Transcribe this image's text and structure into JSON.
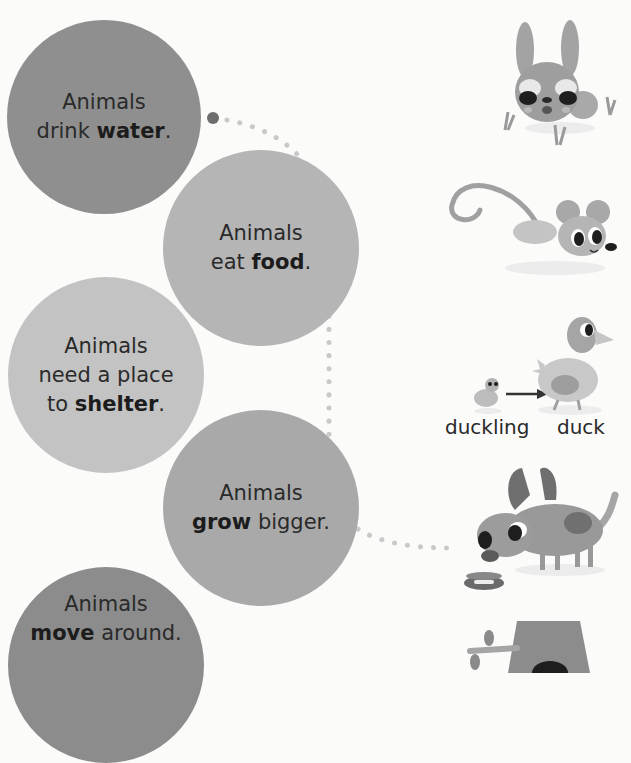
{
  "statements": [
    {
      "lead": "Animals",
      "pre": "drink ",
      "bold": "water",
      "post": "."
    },
    {
      "lead": "Animals",
      "pre": "eat ",
      "bold": "food",
      "post": "."
    },
    {
      "lead": "Animals",
      "line2": "need a place",
      "pre": "to ",
      "bold": "shelter",
      "post": "."
    },
    {
      "lead": "Animals",
      "pre": "",
      "bold": "grow",
      "post": " bigger."
    },
    {
      "lead": "Animals",
      "pre": "",
      "bold": "move",
      "post": " around."
    }
  ],
  "illustrations": {
    "rabbit": "rabbit-eating-grass",
    "mouse": "running-mouse",
    "duck": {
      "from_label": "duckling",
      "to_label": "duck"
    },
    "dog": "dog-drinking-from-bowl",
    "tree": "tree-with-hollow"
  },
  "colors": {
    "background": "#fbfbfa",
    "circle_water": "#8f8f8f",
    "circle_food": "#b5b5b5",
    "circle_shelter": "#c3c3c3",
    "circle_grow": "#a9a9a9",
    "circle_move": "#8c8c8c",
    "dot_connector": "#c9c9c9",
    "dot_start": "#6d6d6d"
  }
}
